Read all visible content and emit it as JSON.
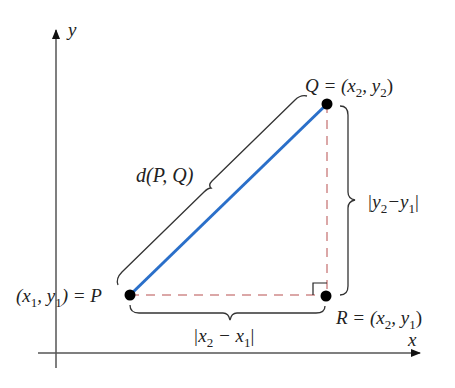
{
  "diagram": {
    "axes": {
      "x_label": "x",
      "y_label": "y"
    },
    "points": {
      "P": {
        "name": "P",
        "label_prefix": "(x",
        "label_sub1": "1",
        "label_mid": ", y",
        "label_sub2": "1",
        "label_suffix": ") = P"
      },
      "Q": {
        "name": "Q",
        "label_prefix": "Q = (x",
        "label_sub1": "2",
        "label_mid": ", y",
        "label_sub2": "2",
        "label_suffix": ")"
      },
      "R": {
        "name": "R",
        "label_prefix": "R = (x",
        "label_sub1": "2",
        "label_mid": ", y",
        "label_sub2": "1",
        "label_suffix": ")"
      }
    },
    "segments": {
      "hypotenuse": {
        "label": "d(P, Q)",
        "color": "#2a6fc9"
      },
      "horizontal": {
        "label_prefix": "|x",
        "label_sub1": "2",
        "label_mid": " − x",
        "label_sub2": "1",
        "label_suffix": "|",
        "color": "#d08a8a"
      },
      "vertical": {
        "label_prefix": "|y",
        "label_sub1": "2",
        "label_mid": "−y",
        "label_sub2": "1",
        "label_suffix": "|",
        "color": "#d08a8a"
      }
    },
    "colors": {
      "axis": "#555555",
      "brace": "#333333",
      "point": "#000000",
      "hypotenuse": "#2a6fc9",
      "legs": "#d08a8a"
    }
  }
}
